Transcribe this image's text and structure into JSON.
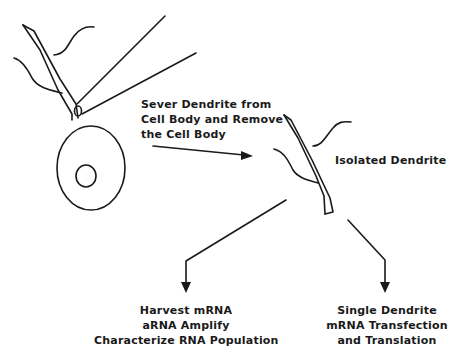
{
  "diagram": {
    "background": "#ffffff",
    "ink_color": "#1a1a1a",
    "step1": {
      "lines": [
        "Sever Dendrite from",
        "Cell Body and Remove",
        "the Cell Body"
      ]
    },
    "isolated_label": "Isolated Dendrite",
    "outcome_left": {
      "lines": [
        "Harvest mRNA",
        "aRNA Amplify",
        "Characterize RNA Population"
      ]
    },
    "outcome_right": {
      "lines": [
        "Single Dendrite",
        "mRNA Transfection",
        "and Translation"
      ]
    },
    "icons": {
      "neuron": "neuron-cell-body-with-dendrite",
      "pipettes": "micropipette-pair",
      "isolated": "isolated-dendrite",
      "arrows": [
        "arrow-right",
        "arrow-down-left",
        "arrow-down-right"
      ]
    }
  }
}
